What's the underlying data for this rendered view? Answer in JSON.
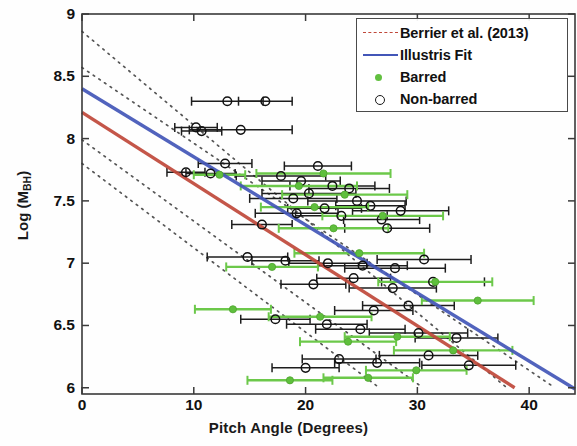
{
  "figure": {
    "background": "#ffffff",
    "axis_color": "#3a3a3a"
  },
  "axes": {
    "x_title": "Pitch Angle (Degrees)",
    "y_title_main": "Log (M",
    "y_title_sub": "BH",
    "y_title_close": ")",
    "xticks": [
      0,
      10,
      20,
      30,
      40
    ],
    "yticks": [
      "9",
      "8.5",
      "8",
      "7.5",
      "7",
      "6.5",
      "6"
    ],
    "xlim": [
      0,
      44.1
    ],
    "ylim": [
      5.95,
      9.0
    ],
    "grid": false
  },
  "legend": {
    "position": "top-right",
    "items": [
      {
        "label": "Berrier et al. (2013)",
        "key": "dashed-line",
        "color": "#c0483a"
      },
      {
        "label": "Illustris Fit",
        "key": "solid-line",
        "color": "#4356b8"
      },
      {
        "label": "Barred",
        "key": "filled-dot",
        "color": "#62c040"
      },
      {
        "label": "Non-barred",
        "key": "open-circle",
        "color": "#1a1a1a"
      }
    ]
  },
  "colors": {
    "illustris_blue": "#4356b8",
    "berrier_red": "#c0483a",
    "barred_green": "#62c040",
    "nonbarred_black": "#1a1a1a",
    "scatter_dotted": "#55555 5"
  },
  "chart_data": {
    "type": "scatter",
    "title": "",
    "xlabel": "Pitch Angle (Degrees)",
    "ylabel": "Log (M_BH)",
    "xlim": [
      0,
      44.1
    ],
    "ylim": [
      5.95,
      9.0
    ],
    "xticks": [
      0,
      10,
      20,
      30,
      40
    ],
    "yticks": [
      6,
      6.5,
      7,
      7.5,
      8,
      8.5,
      9
    ],
    "grid": false,
    "legend_position": "upper right",
    "fit_lines": [
      {
        "name": "Illustris Fit",
        "style": "solid",
        "color": "#4356b8",
        "x": [
          0,
          44.1
        ],
        "y": [
          8.4,
          5.99
        ],
        "slope": -0.0546,
        "intercept": 8.4
      },
      {
        "name": "Berrier et al. (2013)",
        "style": "solid",
        "color": "#c0483a",
        "x": [
          0,
          38.7
        ],
        "y": [
          8.21,
          6.0
        ],
        "slope": -0.0571,
        "intercept": 8.21
      }
    ],
    "scatter_bands": [
      {
        "name": "upper-outer",
        "style": "dotted",
        "color": "#555555",
        "x": [
          0,
          38.0
        ],
        "y": [
          8.86,
          6.0
        ]
      },
      {
        "name": "upper-inner",
        "style": "dotted",
        "color": "#555555",
        "x": [
          0,
          42.3
        ],
        "y": [
          8.57,
          6.0
        ]
      },
      {
        "name": "lower-inner",
        "style": "dotted",
        "color": "#555555",
        "x": [
          0,
          30.5
        ],
        "y": [
          7.99,
          6.0
        ]
      },
      {
        "name": "lower-outer",
        "style": "dotted",
        "color": "#555555",
        "x": [
          0,
          26.6
        ],
        "y": [
          7.8,
          6.0
        ]
      }
    ],
    "series": [
      {
        "name": "Non-barred",
        "marker": "open-circle",
        "color": "#1a1a1a",
        "points": [
          {
            "x": 13.0,
            "y": 8.3,
            "xerr": 3.2
          },
          {
            "x": 16.4,
            "y": 8.3,
            "xerr": 2.4
          },
          {
            "x": 10.2,
            "y": 8.09,
            "xerr": 1.9
          },
          {
            "x": 10.7,
            "y": 8.06,
            "xerr": 1.8
          },
          {
            "x": 14.2,
            "y": 8.07,
            "xerr": 4.6
          },
          {
            "x": 12.8,
            "y": 7.8,
            "xerr": 2.4
          },
          {
            "x": 9.3,
            "y": 7.73,
            "xerr": 1.7
          },
          {
            "x": 11.5,
            "y": 7.72,
            "xerr": 2.2
          },
          {
            "x": 21.1,
            "y": 7.78,
            "xerr": 3.0
          },
          {
            "x": 17.8,
            "y": 7.7,
            "xerr": 4.0
          },
          {
            "x": 19.6,
            "y": 7.66,
            "xerr": 3.5
          },
          {
            "x": 22.4,
            "y": 7.62,
            "xerr": 3.8
          },
          {
            "x": 23.9,
            "y": 7.6,
            "xerr": 3.6
          },
          {
            "x": 20.3,
            "y": 7.56,
            "xerr": 4.2
          },
          {
            "x": 18.9,
            "y": 7.52,
            "xerr": 3.9
          },
          {
            "x": 24.6,
            "y": 7.5,
            "xerr": 4.4
          },
          {
            "x": 25.8,
            "y": 7.46,
            "xerr": 3.1
          },
          {
            "x": 21.7,
            "y": 7.44,
            "xerr": 3.3
          },
          {
            "x": 19.2,
            "y": 7.4,
            "xerr": 3.7
          },
          {
            "x": 23.2,
            "y": 7.38,
            "xerr": 4.1
          },
          {
            "x": 26.8,
            "y": 7.35,
            "xerr": 3.4
          },
          {
            "x": 16.1,
            "y": 7.31,
            "xerr": 2.7
          },
          {
            "x": 28.5,
            "y": 7.42,
            "xerr": 4.3
          },
          {
            "x": 27.3,
            "y": 7.28,
            "xerr": 3.8
          },
          {
            "x": 14.8,
            "y": 7.05,
            "xerr": 3.6
          },
          {
            "x": 18.2,
            "y": 7.02,
            "xerr": 3.0
          },
          {
            "x": 22.0,
            "y": 7.0,
            "xerr": 3.5
          },
          {
            "x": 25.1,
            "y": 6.98,
            "xerr": 4.0
          },
          {
            "x": 28.0,
            "y": 6.96,
            "xerr": 4.5
          },
          {
            "x": 30.6,
            "y": 7.03,
            "xerr": 4.2
          },
          {
            "x": 24.3,
            "y": 6.88,
            "xerr": 3.3
          },
          {
            "x": 20.7,
            "y": 6.83,
            "xerr": 2.9
          },
          {
            "x": 27.8,
            "y": 6.8,
            "xerr": 3.9
          },
          {
            "x": 31.4,
            "y": 6.85,
            "xerr": 4.6
          },
          {
            "x": 29.2,
            "y": 6.66,
            "xerr": 4.1
          },
          {
            "x": 26.1,
            "y": 6.62,
            "xerr": 3.5
          },
          {
            "x": 17.3,
            "y": 6.55,
            "xerr": 3.1
          },
          {
            "x": 21.9,
            "y": 6.51,
            "xerr": 3.6
          },
          {
            "x": 24.9,
            "y": 6.47,
            "xerr": 4.0
          },
          {
            "x": 30.1,
            "y": 6.44,
            "xerr": 4.4
          },
          {
            "x": 33.5,
            "y": 6.4,
            "xerr": 3.7
          },
          {
            "x": 23.0,
            "y": 6.23,
            "xerr": 3.3
          },
          {
            "x": 26.4,
            "y": 6.2,
            "xerr": 3.8
          },
          {
            "x": 34.6,
            "y": 6.18,
            "xerr": 4.2
          },
          {
            "x": 20.0,
            "y": 6.16,
            "xerr": 3.0
          },
          {
            "x": 31.0,
            "y": 6.26,
            "xerr": 4.4
          }
        ]
      },
      {
        "name": "Barred",
        "marker": "filled-dot",
        "color": "#62c040",
        "points": [
          {
            "x": 12.3,
            "y": 7.71,
            "xerr": 2.3
          },
          {
            "x": 21.6,
            "y": 7.72,
            "xerr": 6.0
          },
          {
            "x": 19.4,
            "y": 7.62,
            "xerr": 5.2
          },
          {
            "x": 23.5,
            "y": 7.55,
            "xerr": 5.6
          },
          {
            "x": 20.8,
            "y": 7.45,
            "xerr": 4.8
          },
          {
            "x": 26.9,
            "y": 7.38,
            "xerr": 5.4
          },
          {
            "x": 22.5,
            "y": 7.28,
            "xerr": 4.9
          },
          {
            "x": 24.8,
            "y": 7.08,
            "xerr": 5.8
          },
          {
            "x": 17.0,
            "y": 6.97,
            "xerr": 4.1
          },
          {
            "x": 31.6,
            "y": 6.85,
            "xerr": 5.1
          },
          {
            "x": 13.5,
            "y": 6.63,
            "xerr": 3.4
          },
          {
            "x": 21.3,
            "y": 6.57,
            "xerr": 4.6
          },
          {
            "x": 35.4,
            "y": 6.7,
            "xerr": 5.0
          },
          {
            "x": 28.2,
            "y": 6.41,
            "xerr": 4.7
          },
          {
            "x": 23.8,
            "y": 6.37,
            "xerr": 4.3
          },
          {
            "x": 33.2,
            "y": 6.3,
            "xerr": 5.3
          },
          {
            "x": 29.9,
            "y": 6.14,
            "xerr": 4.5
          },
          {
            "x": 25.6,
            "y": 6.08,
            "xerr": 4.0
          },
          {
            "x": 18.6,
            "y": 6.06,
            "xerr": 3.8
          }
        ]
      }
    ]
  }
}
